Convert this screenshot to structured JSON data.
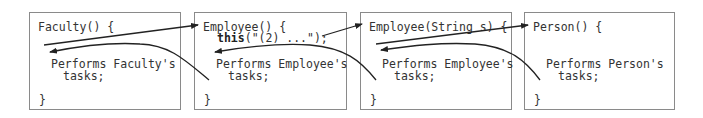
{
  "boxes": [
    {
      "id": "faculty",
      "header": "Faculty() {",
      "body_line1": "Performs Faculty's",
      "body_line2": "tasks;",
      "close": "}"
    },
    {
      "id": "employee-noarg",
      "header": "Employee() {",
      "call_kw": "this",
      "call_rest": "(\"(2) ...\");",
      "body_line1": "Performs Employee's",
      "body_line2": "tasks;",
      "close": "}"
    },
    {
      "id": "employee-string",
      "header": "Employee(String s) {",
      "body_line1": "Performs Employee's",
      "body_line2": "tasks;",
      "close": "}"
    },
    {
      "id": "person",
      "header": "Person() {",
      "body_line1": "Performs Person's",
      "body_line2": "tasks;",
      "close": "}"
    }
  ],
  "colors": {
    "border": "#8a8a8a",
    "text": "#333333",
    "arrow": "#222222"
  }
}
